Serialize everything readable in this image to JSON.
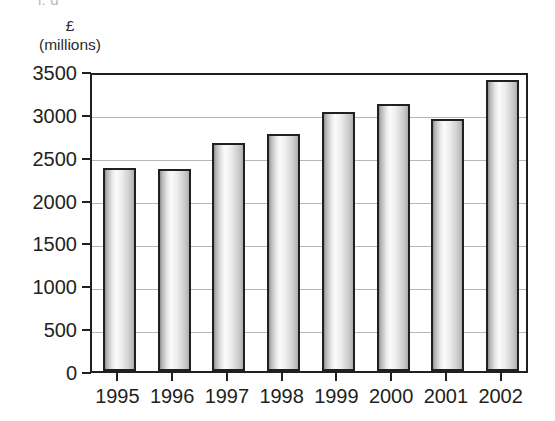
{
  "page": {
    "top_cut_text": "i,   g              "
  },
  "axis_caption": {
    "currency": "£",
    "scale": "(millions)"
  },
  "chart_data": {
    "type": "bar",
    "title": "",
    "subtitle": "",
    "xlabel": "",
    "ylabel": "£ (millions)",
    "categories": [
      "1995",
      "1996",
      "1997",
      "1998",
      "1999",
      "2000",
      "2001",
      "2002"
    ],
    "values": [
      2370,
      2360,
      2660,
      2760,
      3020,
      3120,
      2940,
      3390
    ],
    "series": [
      {
        "name": "",
        "values": [
          2370,
          2360,
          2660,
          2760,
          3020,
          3120,
          2940,
          3390
        ]
      }
    ],
    "ylim": [
      0,
      3500
    ],
    "ytick_labels": [
      "0",
      "500",
      "1000",
      "1500",
      "2000",
      "2500",
      "3000",
      "3500"
    ],
    "ytick_values": [
      0,
      500,
      1000,
      1500,
      2000,
      2500,
      3000,
      3500
    ],
    "grid": true,
    "grid_axis": "y",
    "legend": false,
    "legend_position": "none",
    "bar_fill_style": "cylinder-gradient-grey",
    "colors": {
      "axis": "#231f20",
      "gridline": "#b7b7b7",
      "bar_outline": "#231f20",
      "bar_fill_light": "#fbfbfb",
      "bar_fill_dark": "#8e8e8e",
      "background": "#ffffff"
    }
  }
}
